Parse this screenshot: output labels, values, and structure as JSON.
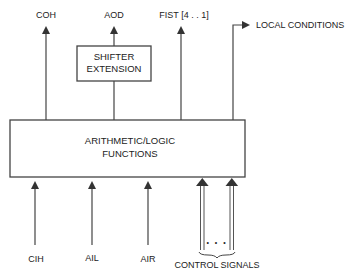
{
  "diagram": {
    "type": "block-diagram",
    "colors": {
      "line": "#444444",
      "text": "#222222",
      "background": "#ffffff"
    },
    "blocks": {
      "alu": {
        "line1": "ARITHMETIC/LOGIC",
        "line2": "FUNCTIONS"
      },
      "shifter": {
        "line1": "SHIFTER",
        "line2": "EXTENSION"
      }
    },
    "outputs": {
      "coh": "COH",
      "aod": "AOD",
      "fist": "FIST [4 . . 1]",
      "local_conditions": "LOCAL CONDITIONS"
    },
    "inputs": {
      "cih": "CIH",
      "ail": "AIL",
      "air": "AIR",
      "control_signals": "CONTROL SIGNALS",
      "control_ellipsis": "• • •"
    }
  }
}
